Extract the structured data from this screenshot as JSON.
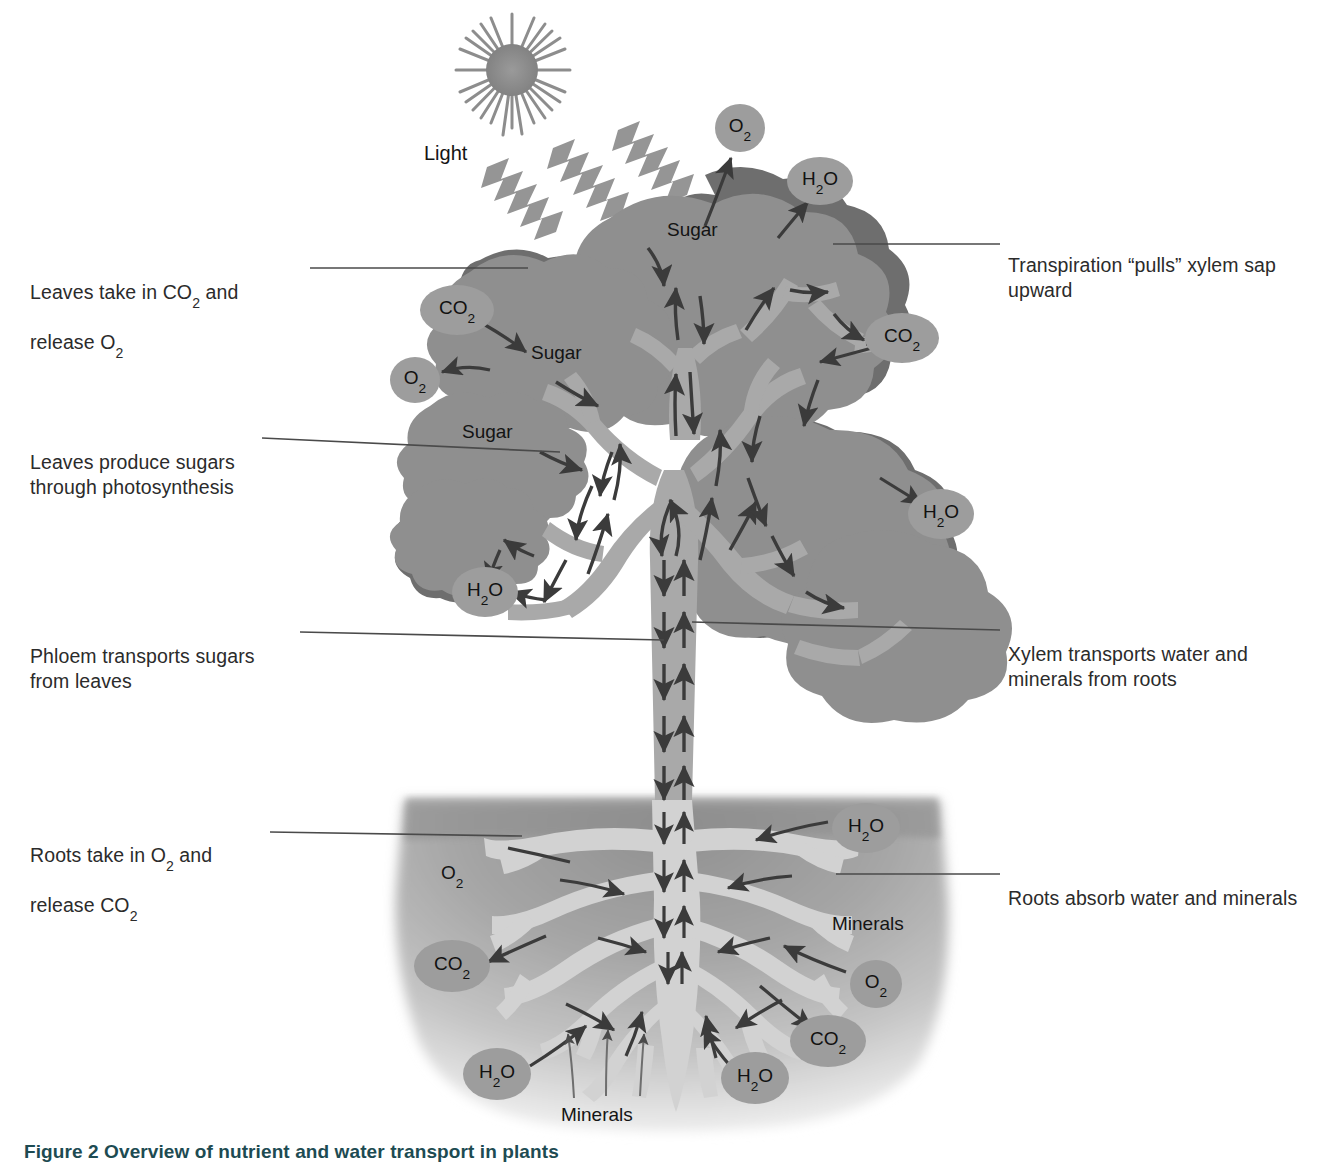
{
  "figure": {
    "caption": "Figure 2 Overview of nutrient and water transport in plants",
    "caption_color": "#1d4b52"
  },
  "colors": {
    "foliage_light": "#8f8f8f",
    "foliage_dark": "#6e6e6e",
    "branch": "#a9a9a9",
    "bubble_fill": "#9d9d9d",
    "soil_top": "#9a9a9a",
    "soil_bottom": "#d7d7d7",
    "root_fill": "#cfcfcf",
    "arrow": "#3b3b3b",
    "leader_line": "#4a4a4a",
    "ray": "#8f8f8f",
    "sun": "#8f8f8f"
  },
  "callouts": {
    "left": [
      {
        "id": "leaves-co2",
        "line1": "Leaves take in CO",
        "sub1": "2",
        "line1_tail": " and",
        "line2": "release O",
        "sub2": "2",
        "x": 30,
        "y": 255
      },
      {
        "id": "leaves-sugars",
        "line1": "Leaves produce sugars",
        "line2": "through photosynthesis",
        "x": 30,
        "y": 412
      },
      {
        "id": "phloem",
        "line1": "Phloem transports sugars",
        "line2": "from leaves",
        "x": 30,
        "y": 619
      },
      {
        "id": "roots-o2",
        "line1": "Roots take in O",
        "sub1": "2",
        "line1_tail": " and",
        "line2": "release CO",
        "sub2": "2",
        "x": 30,
        "y": 818
      }
    ],
    "right": [
      {
        "id": "transpiration",
        "line1": "Transpiration “pulls” xylem sap",
        "line2": "upward",
        "x": 1010,
        "y": 228
      },
      {
        "id": "xylem",
        "line1": "Xylem transports water and",
        "line2": "minerals from roots",
        "x": 1010,
        "y": 617
      },
      {
        "id": "roots-absorb",
        "line1": "Roots absorb water and minerals",
        "line2": "",
        "x": 1010,
        "y": 861
      }
    ]
  },
  "inline_labels": [
    {
      "id": "light",
      "text": "Light",
      "x": 424,
      "y": 142
    },
    {
      "id": "sugar-top",
      "text": "Sugar",
      "x": 667,
      "y": 219
    },
    {
      "id": "sugar-mid",
      "text": "Sugar",
      "x": 531,
      "y": 342
    },
    {
      "id": "sugar-low",
      "text": "Sugar",
      "x": 462,
      "y": 421
    },
    {
      "id": "o2-soil-upper",
      "text": "O",
      "sub": "2",
      "x": 441,
      "y": 862
    },
    {
      "id": "minerals-right",
      "text": "Minerals",
      "x": 832,
      "y": 913
    },
    {
      "id": "minerals-bottom",
      "text": "Minerals",
      "x": 561,
      "y": 1104
    }
  ],
  "bubbles": [
    {
      "id": "o2-canopy-top",
      "text": "O",
      "sub": "2",
      "cx": 740,
      "cy": 128,
      "rx": 25,
      "ry": 24
    },
    {
      "id": "h2o-canopy-topright",
      "text": "H",
      "sub": "2",
      "tail": "O",
      "cx": 820,
      "cy": 181,
      "rx": 33,
      "ry": 24
    },
    {
      "id": "co2-canopy-left",
      "text": "CO",
      "sub": "2",
      "cx": 457,
      "cy": 310,
      "rx": 37,
      "ry": 25
    },
    {
      "id": "co2-canopy-right",
      "text": "CO",
      "sub": "2",
      "cx": 902,
      "cy": 338,
      "rx": 37,
      "ry": 25
    },
    {
      "id": "o2-canopy-left",
      "text": "O",
      "sub": "2",
      "cx": 415,
      "cy": 380,
      "rx": 25,
      "ry": 23
    },
    {
      "id": "h2o-canopy-right",
      "text": "H",
      "sub": "2",
      "tail": "O",
      "cx": 941,
      "cy": 514,
      "rx": 33,
      "ry": 25
    },
    {
      "id": "h2o-canopy-lowleft",
      "text": "H",
      "sub": "2",
      "tail": "O",
      "cx": 485,
      "cy": 592,
      "rx": 33,
      "ry": 25
    },
    {
      "id": "h2o-soil-right",
      "text": "H",
      "sub": "2",
      "tail": "O",
      "cx": 866,
      "cy": 828,
      "rx": 34,
      "ry": 25
    },
    {
      "id": "co2-soil-left",
      "text": "CO",
      "sub": "2",
      "cx": 452,
      "cy": 966,
      "rx": 38,
      "ry": 26
    },
    {
      "id": "o2-soil-right",
      "text": "O",
      "sub": "2",
      "cx": 876,
      "cy": 984,
      "rx": 26,
      "ry": 24
    },
    {
      "id": "co2-soil-right",
      "text": "CO",
      "sub": "2",
      "cx": 828,
      "cy": 1041,
      "rx": 38,
      "ry": 26
    },
    {
      "id": "h2o-soil-left",
      "text": "H",
      "sub": "2",
      "tail": "O",
      "cx": 497,
      "cy": 1074,
      "rx": 34,
      "ry": 26
    },
    {
      "id": "h2o-soil-bottom",
      "text": "H",
      "sub": "2",
      "tail": "O",
      "cx": 755,
      "cy": 1078,
      "rx": 34,
      "ry": 26
    }
  ],
  "diagram": {
    "type": "plant-transport-schematic",
    "sun": {
      "cx": 512,
      "cy": 70,
      "core_r": 26,
      "spikes": 26
    },
    "light_rays": 3,
    "soil_line_y": 798,
    "trunk": {
      "x": 663,
      "top_y": 430,
      "bottom_y": 800,
      "width": 44
    },
    "flows": [
      {
        "name": "phloem-sugar-downward",
        "direction": "down",
        "carries": "sugars"
      },
      {
        "name": "xylem-sap-upward",
        "direction": "up",
        "carries": "water and minerals"
      }
    ]
  }
}
